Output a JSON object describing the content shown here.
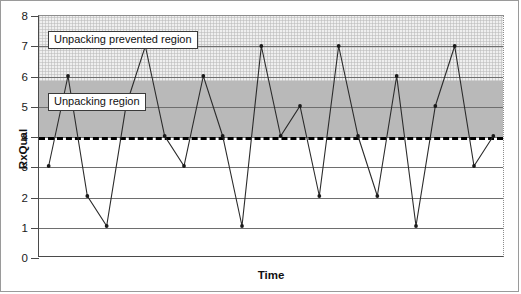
{
  "chart_data": {
    "type": "line",
    "title": "",
    "xlabel": "Time",
    "ylabel": "RxQual",
    "ylim": [
      0,
      8
    ],
    "ytick_labels": [
      "0",
      "1",
      "2",
      "3",
      "4",
      "5",
      "6",
      "7",
      "8"
    ],
    "ytick_values": [
      0,
      1,
      2,
      3,
      4,
      5,
      6,
      7,
      8
    ],
    "xtick_labels": [],
    "grid": "horizontal",
    "legend_position": "none",
    "series": [
      {
        "name": "RxQual",
        "marker": "dot",
        "color": "#2b2b2b",
        "x": [
          1,
          2,
          3,
          4,
          5,
          6,
          7,
          8,
          9,
          10,
          11,
          12,
          13,
          14,
          15,
          16,
          17,
          18,
          19,
          20,
          21,
          22,
          23,
          24
        ],
        "values": [
          3,
          6,
          2,
          1,
          5,
          7,
          4,
          3,
          6,
          4,
          1,
          7,
          4,
          5,
          2,
          7,
          4,
          2,
          6,
          1,
          5,
          7,
          3,
          4
        ]
      }
    ],
    "bands": [
      {
        "name": "Unpacking prevented region",
        "label": "Unpacking prevented region",
        "y_from": 5.85,
        "y_to": 8,
        "fill": "#efefef",
        "pattern": "dotted"
      },
      {
        "name": "Unpacking region",
        "label": "Unpacking region",
        "y_from": 4,
        "y_to": 5.85,
        "fill": "#b9b9b9",
        "pattern": "solid"
      }
    ],
    "threshold_line": {
      "name": "unpacking-threshold",
      "value": 4,
      "style": "dashed",
      "color": "#000000"
    }
  }
}
